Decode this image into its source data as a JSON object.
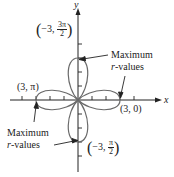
{
  "figure": {
    "type": "polar-rose",
    "axes": {
      "x_label": "x",
      "y_label": "y"
    },
    "points": {
      "top": {
        "r": "−3",
        "theta_num": "3π",
        "theta_den": "2"
      },
      "left": {
        "text": "(3, π)"
      },
      "right": {
        "text": "(3, 0)"
      },
      "bottom": {
        "r": "−3",
        "theta_num": "π",
        "theta_den": "2"
      }
    },
    "annotations": {
      "upper": {
        "line1": "Maximum",
        "line2_var": "r",
        "line2_rest": "-values"
      },
      "lower": {
        "line1": "Maximum",
        "line2_var": "r",
        "line2_rest": "-values"
      }
    },
    "colors": {
      "curve": "#6a6a6a",
      "axis": "#222222",
      "text": "#222222"
    }
  }
}
